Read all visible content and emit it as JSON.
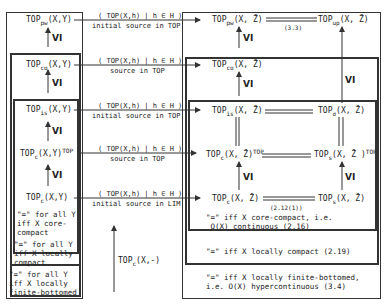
{
  "left": {
    "nodes": [
      {
        "base": "TOP",
        "sub": "pw",
        "arg": "(X,Y)",
        "sup": ""
      },
      {
        "base": "TOP",
        "sub": "co",
        "arg": "(X,Y)",
        "sup": ""
      },
      {
        "base": "TOP",
        "sub": "is",
        "arg": "(X,Y)",
        "sup": ""
      },
      {
        "base": "TOP",
        "sub": "c",
        "arg": "(X,Y)",
        "sup": "TOP"
      },
      {
        "base": "TOP",
        "sub": "c",
        "arg": "(X,Y)",
        "sup": ""
      }
    ],
    "notes": [
      "\"=\" for all Y\niff X core-\ncompact",
      "\"=\" for all Y\niff X locally\ncompact",
      "\"=\" for all Y\niff X locally\nfinite-bottomed"
    ],
    "vi": "VI"
  },
  "middle": {
    "arrows": [
      {
        "family": "( TOP(X,h) | h ∈ H )",
        "caption": "initial source in TOP"
      },
      {
        "family": "( TOP(X,h) | h ∈ H )",
        "caption": "source in TOP"
      },
      {
        "family": "( TOP(X,h) | h ∈ H )",
        "caption": "initial source in TOP"
      },
      {
        "family": "( TOP(X,h) | h ∈ H )",
        "caption": "source in TOP"
      },
      {
        "family": "( TOP(X,h) | h ∈ H )",
        "caption": "initial source in LIM"
      }
    ],
    "functor": {
      "base": "TOP",
      "sub": "c",
      "arg": "(X,-)"
    }
  },
  "right": {
    "nodes": [
      {
        "base": "TOP",
        "sub": "pw",
        "arg": "(X, Z̄)",
        "sup": ""
      },
      {
        "base": "TOP",
        "sub": "co",
        "arg": "(X, Z̄)",
        "sup": ""
      },
      {
        "base": "TOP",
        "sub": "is",
        "arg": "(X, Z̄)",
        "sup": ""
      },
      {
        "base": "TOP",
        "sub": "c",
        "arg": "(X, Z̄)",
        "sup": "TOP"
      },
      {
        "base": "TOP",
        "sub": "c",
        "arg": "(X, Z̄)",
        "sup": ""
      }
    ],
    "far_nodes": [
      {
        "base": "TOP",
        "sub": "up",
        "arg": "(X, Z̄)",
        "sup": ""
      },
      {
        "base": "TOP",
        "sub": "σ",
        "arg": "(X, Z̄)",
        "sup": ""
      },
      {
        "base": "TOP",
        "sub": "s",
        "arg": "(X, Z̄ )",
        "sup": "TOP"
      },
      {
        "base": "TOP",
        "sub": "s",
        "arg": "(X, Z̄)",
        "sup": ""
      }
    ],
    "refs": {
      "top": "(3.3)",
      "bottom": "(2.12(1))"
    },
    "notes": [
      "\"=\" iff X core-compact, i.e.\n O(X) continuous (2.16)",
      "\"=\" iff X locally compact (2.19)",
      "\"=\" iff X locally finite-bottomed,\ni.e. O(X) hypercontinuous (3.4)"
    ],
    "vi": "VI"
  }
}
